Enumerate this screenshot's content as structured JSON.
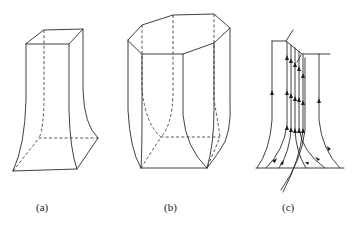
{
  "figure": {
    "panels": [
      {
        "id": "a",
        "label": "(a)",
        "description": "square prism flaring outward at base"
      },
      {
        "id": "b",
        "label": "(b)",
        "description": "octagonal prism with flared base"
      },
      {
        "id": "c",
        "label": "(c)",
        "description": "flow lines with upward arrows along flared surfaces"
      }
    ],
    "colors": {
      "line": "#2a2a2a",
      "background": "#ffffff"
    }
  }
}
